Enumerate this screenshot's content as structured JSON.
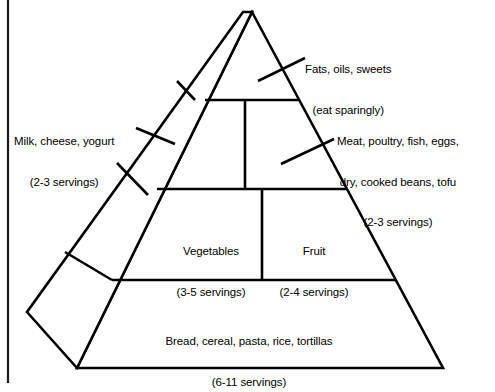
{
  "diagram": {
    "type": "food-pyramid",
    "stroke_color": "#000000",
    "fill_color": "#ffffff",
    "background_color": "#ffffff",
    "frame": {
      "left_border_color": "#1a1a1a"
    },
    "tiers": [
      {
        "id": "fats",
        "level": 1,
        "label_line1": "Fats, oils, sweets",
        "label_line2": "(eat sparingly)",
        "servings": "eat sparingly",
        "label_position": "outside-right",
        "has_leader_line": true
      },
      {
        "id": "milk",
        "level": 2,
        "label_line1": "Milk, cheese, yogurt",
        "label_line2": "(2-3 servings)",
        "servings": "2-3",
        "label_position": "outside-left",
        "has_leader_line": true
      },
      {
        "id": "meat",
        "level": 2,
        "label_line1": "Meat, poultry, fish, eggs,",
        "label_line2": "dry, cooked beans, tofu",
        "label_line3": "(2-3 servings)",
        "servings": "2-3",
        "label_position": "outside-right",
        "has_leader_line": true
      },
      {
        "id": "vegetables",
        "level": 3,
        "label_line1": "Vegetables",
        "label_line2": "(3-5 servings)",
        "servings": "3-5",
        "label_position": "inside",
        "has_leader_line": false
      },
      {
        "id": "fruit",
        "level": 3,
        "label_line1": "Fruit",
        "label_line2": "(2-4 servings)",
        "servings": "2-4",
        "label_position": "inside",
        "has_leader_line": false
      },
      {
        "id": "bread",
        "level": 4,
        "label_line1": "Bread, cereal, pasta, rice, tortillas",
        "label_line2": "(6-11 servings)",
        "servings": "6-11",
        "label_position": "inside",
        "has_leader_line": false
      }
    ]
  }
}
